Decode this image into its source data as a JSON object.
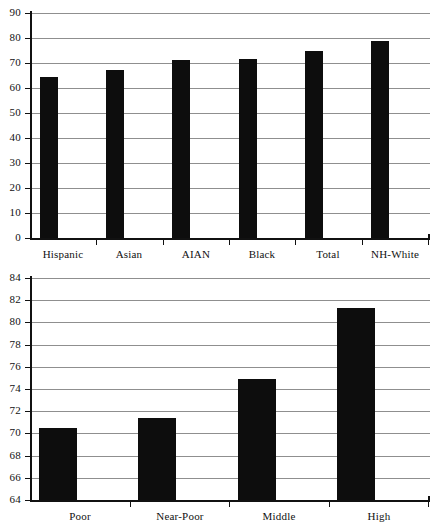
{
  "figure": {
    "background_color": "#ffffff",
    "bar_color": "#0d0d0d",
    "gridline_color": "#8f8f8f",
    "axis_color": "#111111"
  },
  "chart_data": [
    {
      "id": "top",
      "type": "bar",
      "title": "",
      "subtitle": "",
      "xlabel": "",
      "ylabel": "",
      "categories": [
        "Hispanic",
        "Asian",
        "AIAN",
        "Black",
        "Total",
        "NH-White"
      ],
      "values": [
        64.4,
        67.2,
        71.2,
        71.6,
        74.8,
        78.8
      ],
      "ylim": [
        0,
        90
      ],
      "yticks": [
        0,
        10,
        20,
        30,
        40,
        50,
        60,
        70,
        80,
        90
      ],
      "ytick_labels": [
        "0",
        "10",
        "20",
        "30",
        "40",
        "50",
        "60",
        "70",
        "80",
        "90"
      ],
      "grid": true,
      "legend": false,
      "legend_position": "none",
      "bar_width_px": 18
    },
    {
      "id": "bottom",
      "type": "bar",
      "title": "",
      "subtitle": "",
      "xlabel": "",
      "ylabel": "",
      "categories": [
        "Poor",
        "Near-Poor",
        "Middle",
        "High"
      ],
      "values": [
        70.5,
        71.4,
        74.9,
        81.3
      ],
      "ylim": [
        64,
        84
      ],
      "yticks": [
        64,
        66,
        68,
        70,
        72,
        74,
        76,
        78,
        80,
        82,
        84
      ],
      "ytick_labels": [
        "64",
        "66",
        "68",
        "70",
        "72",
        "74",
        "76",
        "78",
        "80",
        "82",
        "84"
      ],
      "grid": true,
      "legend": false,
      "legend_position": "none",
      "bar_width_px": 38
    }
  ]
}
